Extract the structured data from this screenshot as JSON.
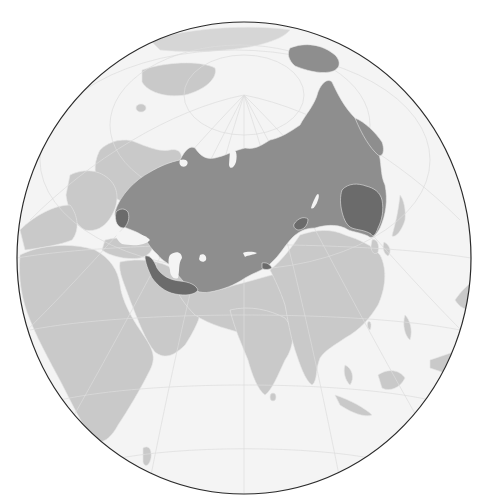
{
  "map": {
    "projection": "orthographic",
    "centered_on": "Central Asia",
    "title": "Locator map: Russian Empire and annexed territories",
    "colors": {
      "background": "#ffffff",
      "ocean": "#f4f4f4",
      "globe_outline": "#2a2a2a",
      "graticule": "#dcdcdc",
      "other_land": "#c9c9c9",
      "highlight_territory": "#8e8e8e",
      "highlight_subregions": "#6b6b6b",
      "borders": "#e6e6e6"
    },
    "legend": [],
    "layers": [
      {
        "name": "ocean",
        "color": "#f4f4f4"
      },
      {
        "name": "other-countries",
        "color": "#c9c9c9"
      },
      {
        "name": "highlighted-empire",
        "color": "#8e8e8e"
      },
      {
        "name": "darker-highlighted-regions",
        "color": "#6b6b6b"
      },
      {
        "name": "graticule",
        "color": "#dcdcdc"
      }
    ]
  }
}
